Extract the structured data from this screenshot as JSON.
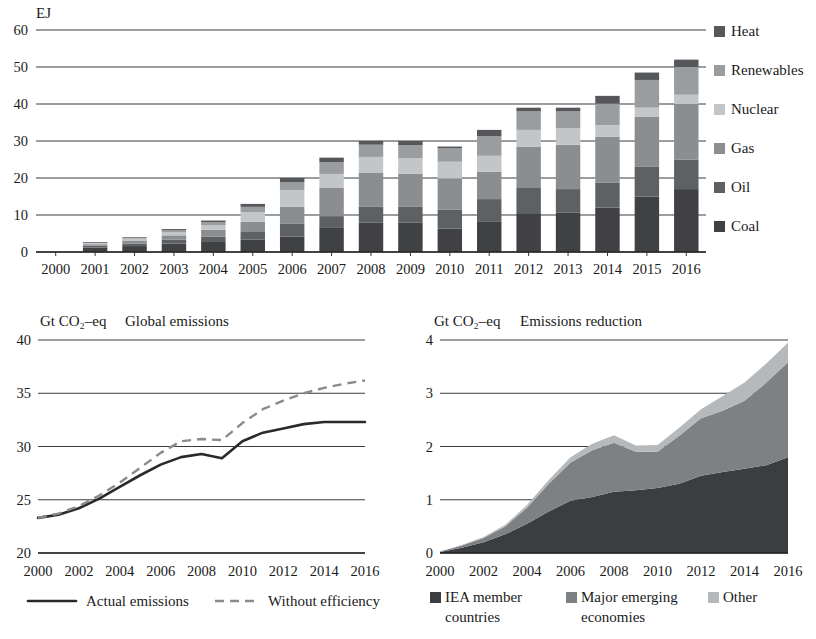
{
  "top_chart": {
    "unit_label": "EJ",
    "legend": [
      {
        "label": "Heat",
        "color": "#55575a"
      },
      {
        "label": "Renewables",
        "color": "#9a9da0"
      },
      {
        "label": "Nuclear",
        "color": "#c3c6c8"
      },
      {
        "label": "Gas",
        "color": "#8b8e91"
      },
      {
        "label": "Oil",
        "color": "#5e6164"
      },
      {
        "label": "Coal",
        "color": "#3f4144"
      }
    ],
    "chart_data": {
      "type": "bar",
      "title": "",
      "xlabel": "",
      "ylabel": "EJ",
      "ylim": [
        0,
        60
      ],
      "yticks": [
        0,
        10,
        20,
        30,
        40,
        50,
        60
      ],
      "grid": true,
      "stacked": true,
      "legend_position": "right",
      "categories": [
        "2000",
        "2001",
        "2002",
        "2003",
        "2004",
        "2005",
        "2006",
        "2007",
        "2008",
        "2009",
        "2010",
        "2011",
        "2012",
        "2013",
        "2014",
        "2015",
        "2016"
      ],
      "series": [
        {
          "name": "Coal",
          "color": "#3f4144",
          "values": [
            0.0,
            1.2,
            1.6,
            2.3,
            2.7,
            3.4,
            4.2,
            6.5,
            8.0,
            8.0,
            6.3,
            8.3,
            10.5,
            10.6,
            12.0,
            15.0,
            17.0
          ]
        },
        {
          "name": "Oil",
          "color": "#5e6164",
          "values": [
            0.0,
            0.5,
            0.7,
            1.0,
            1.5,
            2.2,
            3.4,
            3.2,
            4.2,
            4.2,
            5.2,
            6.0,
            7.0,
            6.4,
            6.8,
            8.0,
            8.0
          ]
        },
        {
          "name": "Gas",
          "color": "#8b8e91",
          "values": [
            0.0,
            0.4,
            0.8,
            1.2,
            1.8,
            2.6,
            4.6,
            7.6,
            9.3,
            9.0,
            8.4,
            7.4,
            11.0,
            12.0,
            12.3,
            13.5,
            15.0
          ]
        },
        {
          "name": "Nuclear",
          "color": "#c3c6c8",
          "values": [
            0.0,
            0.3,
            0.5,
            0.8,
            1.2,
            2.6,
            4.5,
            3.8,
            4.2,
            4.2,
            4.5,
            4.3,
            4.5,
            4.5,
            3.2,
            2.5,
            2.5
          ]
        },
        {
          "name": "Renewables",
          "color": "#9a9da0",
          "values": [
            0.0,
            0.2,
            0.3,
            0.6,
            0.9,
            1.4,
            2.2,
            3.2,
            3.3,
            3.5,
            3.6,
            5.3,
            5.0,
            4.5,
            5.8,
            7.5,
            7.5
          ]
        },
        {
          "name": "Heat",
          "color": "#55575a",
          "values": [
            0.0,
            0.1,
            0.1,
            0.3,
            0.4,
            0.8,
            1.1,
            1.2,
            1.0,
            1.1,
            0.5,
            1.7,
            1.0,
            1.0,
            2.1,
            2.0,
            2.0
          ]
        }
      ],
      "totals": [
        0.0,
        2.7,
        4.0,
        6.2,
        8.5,
        13.0,
        20.0,
        25.5,
        30.0,
        30.0,
        28.5,
        33.0,
        39.0,
        39.0,
        42.2,
        48.5,
        52.0
      ]
    }
  },
  "bottom_left_chart": {
    "unit_label": "Gt CO₂–eq",
    "title": "Global emissions",
    "legend": [
      {
        "label": "Actual emissions",
        "style": "solid",
        "color": "#2a2a2a"
      },
      {
        "label": "Without efficiency",
        "style": "dashed",
        "color": "#8a8a8a"
      }
    ],
    "chart_data": {
      "type": "line",
      "title": "Global emissions",
      "xlabel": "",
      "ylabel": "Gt CO2-eq",
      "ylim": [
        20,
        40
      ],
      "yticks": [
        20,
        25,
        30,
        35,
        40
      ],
      "xticks": [
        "2000",
        "2002",
        "2004",
        "2006",
        "2008",
        "2010",
        "2012",
        "2014",
        "2016"
      ],
      "grid": true,
      "legend_position": "bottom",
      "x": [
        2000,
        2001,
        2002,
        2003,
        2004,
        2005,
        2006,
        2007,
        2008,
        2009,
        2010,
        2011,
        2012,
        2013,
        2014,
        2015,
        2016
      ],
      "series": [
        {
          "name": "Actual emissions",
          "style": "solid",
          "color": "#2a2a2a",
          "values": [
            23.3,
            23.6,
            24.2,
            25.1,
            26.2,
            27.3,
            28.3,
            29.0,
            29.3,
            28.9,
            30.5,
            31.3,
            31.7,
            32.1,
            32.3,
            32.3,
            32.3
          ]
        },
        {
          "name": "Without efficiency",
          "style": "dashed",
          "color": "#8a8a8a",
          "values": [
            23.3,
            23.7,
            24.4,
            25.4,
            26.6,
            28.0,
            29.4,
            30.5,
            30.7,
            30.6,
            32.2,
            33.5,
            34.3,
            35.0,
            35.5,
            35.9,
            36.2
          ]
        }
      ]
    }
  },
  "bottom_right_chart": {
    "unit_label": "Gt CO₂–eq",
    "title": "Emissions reduction",
    "legend": [
      {
        "label_line1": "IEA member",
        "label_line2": "countries",
        "color": "#3b3d40"
      },
      {
        "label_line1": "Major emerging",
        "label_line2": "economies",
        "color": "#7e8184"
      },
      {
        "label_line1": "Other",
        "label_line2": "",
        "color": "#b6b9bb"
      }
    ],
    "chart_data": {
      "type": "area",
      "title": "Emissions reduction",
      "xlabel": "",
      "ylabel": "Gt CO2-eq",
      "ylim": [
        0,
        4
      ],
      "yticks": [
        0,
        1,
        2,
        3,
        4
      ],
      "xticks": [
        "2000",
        "2002",
        "2004",
        "2006",
        "2008",
        "2010",
        "2012",
        "2014",
        "2016"
      ],
      "grid": true,
      "stacked": true,
      "legend_position": "bottom",
      "x": [
        2000,
        2001,
        2002,
        2003,
        2004,
        2005,
        2006,
        2007,
        2008,
        2009,
        2010,
        2011,
        2012,
        2013,
        2014,
        2015,
        2016
      ],
      "series": [
        {
          "name": "IEA member countries",
          "color": "#3b3d40",
          "values": [
            0.02,
            0.1,
            0.2,
            0.35,
            0.55,
            0.78,
            0.98,
            1.05,
            1.15,
            1.18,
            1.22,
            1.3,
            1.45,
            1.52,
            1.58,
            1.65,
            1.8
          ]
        },
        {
          "name": "Major emerging economies",
          "color": "#7e8184",
          "values": [
            0.01,
            0.04,
            0.08,
            0.15,
            0.3,
            0.52,
            0.72,
            0.88,
            0.92,
            0.72,
            0.68,
            0.9,
            1.08,
            1.15,
            1.28,
            1.55,
            1.78
          ]
        },
        {
          "name": "Other",
          "color": "#b6b9bb",
          "values": [
            0.0,
            0.01,
            0.02,
            0.03,
            0.05,
            0.07,
            0.1,
            0.12,
            0.14,
            0.12,
            0.13,
            0.15,
            0.17,
            0.28,
            0.34,
            0.36,
            0.37
          ]
        }
      ],
      "totals": [
        0.03,
        0.15,
        0.3,
        0.53,
        0.9,
        1.37,
        1.8,
        2.05,
        2.21,
        2.02,
        2.03,
        2.35,
        2.7,
        2.95,
        3.2,
        3.56,
        3.95
      ]
    }
  }
}
